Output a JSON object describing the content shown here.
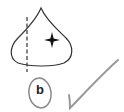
{
  "diagram": {
    "label": "b",
    "shapes": [
      "drop-shape",
      "dashed-vertical-line",
      "four-point-star",
      "circled-label",
      "checkmark"
    ]
  },
  "colors": {
    "stroke": "#333333",
    "circle": "#888888",
    "check": "#999999",
    "star": "#111111"
  }
}
